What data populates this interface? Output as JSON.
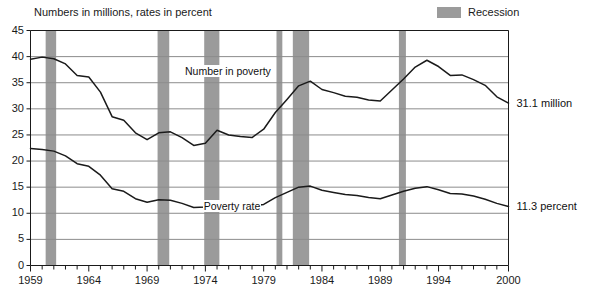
{
  "chart_data": {
    "type": "line",
    "title": "Numbers in millions, rates in percent",
    "xlabel": "",
    "ylabel": "",
    "ylim": [
      0,
      45
    ],
    "xlim": [
      1959,
      2000
    ],
    "ytick_step": 5,
    "grid": true,
    "legend_position": "top-right",
    "x": [
      1959,
      1960,
      1961,
      1962,
      1963,
      1964,
      1965,
      1966,
      1967,
      1968,
      1969,
      1970,
      1971,
      1972,
      1973,
      1974,
      1975,
      1976,
      1977,
      1978,
      1979,
      1980,
      1981,
      1982,
      1983,
      1984,
      1985,
      1986,
      1987,
      1988,
      1989,
      1990,
      1991,
      1992,
      1993,
      1994,
      1995,
      1996,
      1997,
      1998,
      1999,
      2000
    ],
    "yticks": [
      0,
      5,
      10,
      15,
      20,
      25,
      30,
      35,
      40,
      45
    ],
    "xticks": [
      1959,
      1964,
      1969,
      1974,
      1979,
      1984,
      1989,
      1994,
      2000
    ],
    "xtick_labels": [
      "1959",
      "1964",
      "1969",
      "1974",
      "1979",
      "1984",
      "1989",
      "1994",
      "2000"
    ],
    "ytick_labels": [
      "0",
      "5",
      "10",
      "15",
      "20",
      "25",
      "30",
      "35",
      "40",
      "45"
    ],
    "series": [
      {
        "name": "Number in poverty",
        "unit": "millions",
        "label_x": 1975.6,
        "label_y": 37.2,
        "end_label": "31.1 million",
        "values": [
          39.5,
          39.9,
          39.6,
          38.6,
          36.4,
          36.1,
          33.2,
          28.5,
          27.8,
          25.4,
          24.1,
          25.4,
          25.6,
          24.5,
          23.0,
          23.4,
          25.9,
          25.0,
          24.7,
          24.5,
          26.1,
          29.3,
          31.8,
          34.4,
          35.3,
          33.7,
          33.1,
          32.4,
          32.2,
          31.7,
          31.5,
          33.6,
          35.7,
          38.0,
          39.3,
          38.1,
          36.4,
          36.5,
          35.6,
          34.5,
          32.3,
          31.1
        ]
      },
      {
        "name": "Poverty rate",
        "unit": "percent",
        "label_x": 1977.2,
        "label_y": 11.4,
        "end_label": "11.3 percent",
        "values": [
          22.4,
          22.2,
          21.9,
          21.0,
          19.5,
          19.0,
          17.3,
          14.7,
          14.2,
          12.8,
          12.1,
          12.6,
          12.5,
          11.9,
          11.1,
          11.2,
          12.3,
          11.8,
          11.6,
          11.4,
          11.7,
          13.0,
          14.0,
          15.0,
          15.2,
          14.4,
          14.0,
          13.6,
          13.4,
          13.0,
          12.8,
          13.5,
          14.2,
          14.8,
          15.1,
          14.5,
          13.8,
          13.7,
          13.3,
          12.7,
          11.9,
          11.3
        ]
      }
    ],
    "recessions": [
      {
        "start": 1960.3,
        "end": 1961.2
      },
      {
        "start": 1969.9,
        "end": 1970.9
      },
      {
        "start": 1973.9,
        "end": 1975.2
      },
      {
        "start": 1980.1,
        "end": 1980.6
      },
      {
        "start": 1981.5,
        "end": 1982.9
      },
      {
        "start": 1990.6,
        "end": 1991.2
      }
    ],
    "legend": [
      {
        "label": "Recession",
        "color": "#9b9b9b",
        "type": "band"
      }
    ],
    "colors": {
      "line": "#1a1a1a",
      "recession_band": "#9b9b9b",
      "grid": "#8c8c8c",
      "axis": "#1a1a1a",
      "background": "#ffffff"
    }
  }
}
